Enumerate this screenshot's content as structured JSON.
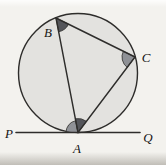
{
  "figure": {
    "type": "geometry-diagram",
    "canvas": {
      "width": 166,
      "height": 165
    },
    "colors": {
      "background": "#f3f2ee",
      "circle_fill": "#e3e2df",
      "stroke": "#2e2d2b",
      "angle_dark": "#54555a",
      "angle_medium": "#8f9196",
      "label": "#151413"
    },
    "circle": {
      "cx": 78,
      "cy": 73,
      "r": 59.5
    },
    "points": {
      "A": {
        "x": 78,
        "y": 132.5
      },
      "B": {
        "x": 56,
        "y": 18
      },
      "C": {
        "x": 135,
        "y": 57
      }
    },
    "tangent_line": {
      "x1": 16,
      "y1": 132.5,
      "x2": 140,
      "y2": 132.5
    },
    "segments": [
      [
        "B",
        "C"
      ],
      [
        "B",
        "A"
      ],
      [
        "C",
        "A"
      ]
    ],
    "angle_marks": [
      {
        "at": "B",
        "toward": [
          "C",
          "A"
        ],
        "radius": 14,
        "shade": "dark"
      },
      {
        "at": "C",
        "toward": [
          "B",
          "A"
        ],
        "radius": 13,
        "shade": "medium"
      },
      {
        "at": "A",
        "toward": [
          {
            "dx": -1,
            "dy": 0
          },
          "B"
        ],
        "radius": 12,
        "shade": "medium"
      },
      {
        "at": "A",
        "toward": [
          "B",
          "C"
        ],
        "radius": 14,
        "shade": "dark"
      }
    ],
    "labels": [
      {
        "text": "B",
        "x": 48,
        "y": 37,
        "anchor": "middle",
        "size": 13
      },
      {
        "text": "C",
        "x": 146,
        "y": 62,
        "anchor": "middle",
        "size": 13
      },
      {
        "text": "A",
        "x": 77,
        "y": 153,
        "anchor": "middle",
        "size": 13
      },
      {
        "text": "P",
        "x": 9,
        "y": 138,
        "anchor": "middle",
        "size": 13
      },
      {
        "text": "Q",
        "x": 148,
        "y": 142,
        "anchor": "middle",
        "size": 13
      }
    ],
    "stroke_width": {
      "circle": 1.4,
      "chord": 1.4,
      "tangent": 1.6
    }
  }
}
